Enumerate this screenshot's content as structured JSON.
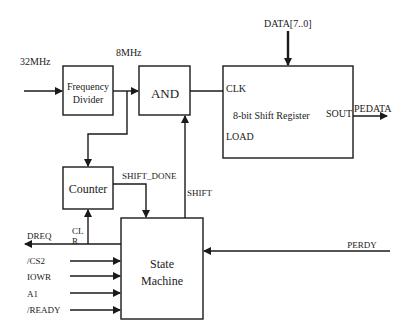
{
  "blocks": {
    "freq_divider": {
      "line1": "Frequency",
      "line2": "Divider"
    },
    "and_gate": {
      "label": "AND"
    },
    "shift_register": {
      "title": "8-bit Shift Register",
      "clk": "CLK",
      "load": "LOAD",
      "sout": "SOUT"
    },
    "counter": {
      "label": "Counter"
    },
    "state_machine": {
      "line1": "State",
      "line2": "Machine"
    }
  },
  "signals": {
    "clk_in": "32MHz",
    "clk_div": "8MHz",
    "data_bus": "DATA[7..0]",
    "pedata": "PEDATA",
    "shift_done": "SHIFT_DONE",
    "shift": "SHIFT",
    "clr_line1": "CL",
    "clr_line2": "R",
    "dreq": "DREQ",
    "cs2": "/CS2",
    "iowr": "IOWR",
    "a1": "A1",
    "ready": "/READY",
    "perdy": "PERDY"
  },
  "colors": {
    "line": "#1a1a1a",
    "background": "#ffffff"
  }
}
